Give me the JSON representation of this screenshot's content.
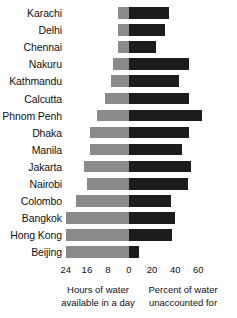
{
  "chart_data": {
    "type": "bar",
    "subtype": "diverging-horizontal-bar",
    "title": "",
    "categories": [
      "Karachi",
      "Delhi",
      "Chennai",
      "Nakuru",
      "Kathmandu",
      "Calcutta",
      "Phnom Penh",
      "Dhaka",
      "Manila",
      "Jakarta",
      "Nairobi",
      "Colombo",
      "Bangkok",
      "Hong Kong",
      "Beijing"
    ],
    "series": [
      {
        "name": "Hours of water available in a day",
        "axis": "left",
        "units": "hours",
        "values": [
          4,
          4,
          4,
          6,
          7,
          9,
          12,
          15,
          15,
          17,
          16,
          20,
          24,
          24,
          24
        ]
      },
      {
        "name": "Percent of water unaccounted for",
        "axis": "right",
        "units": "percent",
        "values": [
          35,
          31,
          23,
          52,
          43,
          52,
          63,
          52,
          46,
          54,
          51,
          36,
          40,
          37,
          9
        ]
      }
    ],
    "left_axis": {
      "label_line1": "Hours of water",
      "label_line2": "available in a day",
      "ticks": [
        24,
        16,
        8,
        0
      ],
      "range": [
        24,
        0
      ],
      "direction": "reversed"
    },
    "right_axis": {
      "label_line1": "Percent of water",
      "label_line2": "unaccounted for",
      "ticks": [
        0,
        20,
        40,
        60
      ],
      "range": [
        0,
        60
      ],
      "direction": "normal"
    },
    "colors": {
      "left_series": "#8a8a8a",
      "right_series": "#1c1c1c",
      "background": "#ffffff",
      "text": "#111111"
    },
    "grid": false,
    "legend": "none"
  },
  "axis_ticks": [
    {
      "text": "24"
    },
    {
      "text": "16"
    },
    {
      "text": "8"
    },
    {
      "text": "0"
    },
    {
      "text": "20"
    },
    {
      "text": "40"
    },
    {
      "text": "60"
    }
  ],
  "captions": {
    "left_line1": "Hours of water",
    "left_line2": "available in a day",
    "right_line1": "Percent of water",
    "right_line2": "unaccounted for"
  }
}
